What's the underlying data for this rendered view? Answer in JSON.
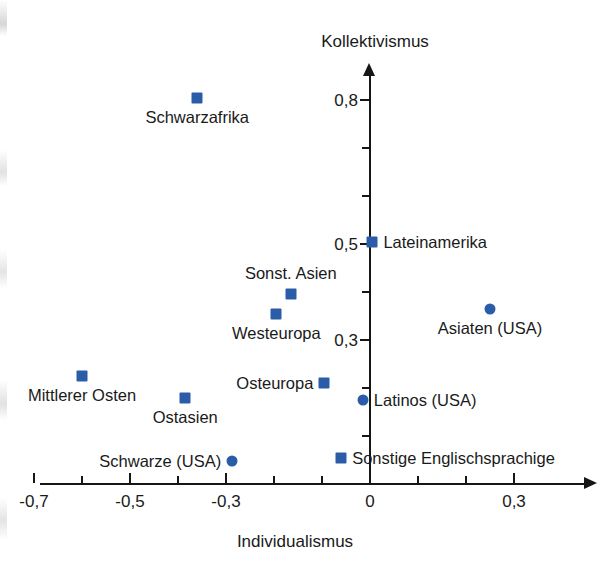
{
  "chart_data": {
    "type": "scatter",
    "title": "",
    "xlabel": "Individualismus",
    "ylabel": "Kollektivismus",
    "xlim": [
      -0.73,
      0.37
    ],
    "ylim": [
      0.0,
      0.87
    ],
    "grid": false,
    "legend": "none",
    "x_ticks": [
      -0.7,
      -0.6,
      -0.5,
      -0.4,
      -0.3,
      -0.2,
      -0.1,
      0,
      0.1,
      0.2,
      0.3
    ],
    "x_tick_labels": [
      "-0,7",
      "",
      "-0,5",
      "",
      "-0,3",
      "",
      "",
      "0",
      "",
      "",
      "0,3"
    ],
    "y_ticks": [
      0.1,
      0.2,
      0.3,
      0.4,
      0.5,
      0.6,
      0.7,
      0.8
    ],
    "y_tick_labels": [
      "",
      "",
      "0,3",
      "",
      "0,5",
      "",
      "",
      "0,8"
    ],
    "series": [
      {
        "name": "Weltregionen",
        "marker": "square",
        "color": "#2b5ca8",
        "points": [
          {
            "label": "Schwarzafrika",
            "x": -0.36,
            "y": 0.805,
            "label_pos": "below"
          },
          {
            "label": "Lateinamerika",
            "x": 0.005,
            "y": 0.505,
            "label_pos": "right"
          },
          {
            "label": "Sonst. Asien",
            "x": -0.165,
            "y": 0.395,
            "label_pos": "above"
          },
          {
            "label": "Westeuropa",
            "x": -0.195,
            "y": 0.355,
            "label_pos": "below"
          },
          {
            "label": "Mittlerer Osten",
            "x": -0.6,
            "y": 0.225,
            "label_pos": "below"
          },
          {
            "label": "Ostasien",
            "x": -0.385,
            "y": 0.18,
            "label_pos": "below"
          },
          {
            "label": "Osteuropa",
            "x": -0.095,
            "y": 0.21,
            "label_pos": "left"
          },
          {
            "label": "Sonstige Englischsprachige",
            "x": -0.06,
            "y": 0.055,
            "label_pos": "right"
          }
        ]
      },
      {
        "name": "US-Ethnien",
        "marker": "circle",
        "color": "#2b5ca8",
        "points": [
          {
            "label": "Asiaten (USA)",
            "x": 0.25,
            "y": 0.365,
            "label_pos": "below"
          },
          {
            "label": "Latinos (USA)",
            "x": -0.015,
            "y": 0.175,
            "label_pos": "right"
          },
          {
            "label": "Schwarze (USA)",
            "x": -0.287,
            "y": 0.048,
            "label_pos": "left"
          }
        ]
      }
    ]
  },
  "axes": {
    "x_title": "Individualismus",
    "y_title": "Kollektivismus"
  }
}
